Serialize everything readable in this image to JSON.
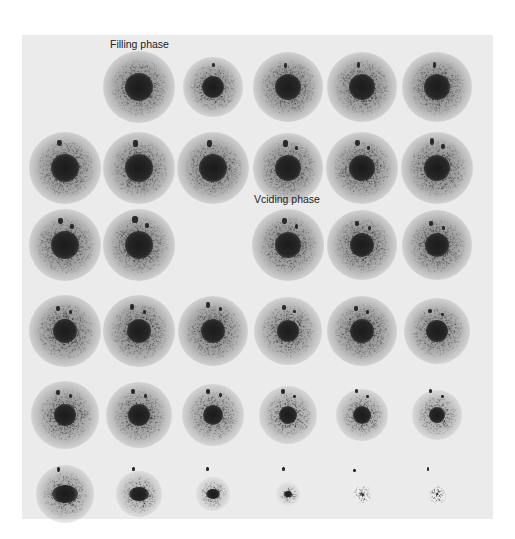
{
  "figure": {
    "labels": {
      "filling": "Filling phase",
      "voiding": "Vciding phase"
    },
    "colors": {
      "page_bg": "#ffffff",
      "panel_bg": "#ebebeb",
      "core": "#1b1b1b",
      "text": "#222222"
    },
    "grid": {
      "rows": 6,
      "cols": 6,
      "col_x": [
        65,
        139,
        213,
        288,
        362,
        437
      ],
      "row_y": [
        87,
        168,
        245,
        331,
        415,
        494
      ]
    },
    "frames": [
      {
        "row": 0,
        "col": 1,
        "r": 14,
        "halo": 28,
        "sats": []
      },
      {
        "row": 0,
        "col": 2,
        "r": 11,
        "halo": 23,
        "sats": [
          [
            0,
            -22,
            3,
            4
          ]
        ]
      },
      {
        "row": 0,
        "col": 3,
        "r": 13,
        "halo": 27,
        "sats": [
          [
            -3,
            -22,
            3,
            5
          ]
        ]
      },
      {
        "row": 0,
        "col": 4,
        "r": 13,
        "halo": 27,
        "sats": [
          [
            -4,
            -22,
            3,
            6
          ]
        ]
      },
      {
        "row": 0,
        "col": 5,
        "r": 13,
        "halo": 27,
        "sats": [
          [
            -3,
            -22,
            3,
            6
          ]
        ]
      },
      {
        "row": 1,
        "col": 0,
        "r": 14,
        "halo": 28,
        "sats": [
          [
            -6,
            -25,
            5,
            6
          ]
        ]
      },
      {
        "row": 1,
        "col": 1,
        "r": 14,
        "halo": 28,
        "sats": [
          [
            -4,
            -25,
            5,
            7
          ]
        ]
      },
      {
        "row": 1,
        "col": 2,
        "r": 14,
        "halo": 28,
        "sats": [
          [
            -4,
            -25,
            5,
            7
          ]
        ]
      },
      {
        "row": 1,
        "col": 3,
        "r": 13,
        "halo": 27,
        "sats": [
          [
            -3,
            -25,
            5,
            7
          ],
          [
            8,
            -20,
            3,
            4
          ]
        ]
      },
      {
        "row": 1,
        "col": 4,
        "r": 13,
        "halo": 28,
        "sats": [
          [
            -5,
            -25,
            5,
            6
          ],
          [
            6,
            -20,
            3,
            4
          ]
        ]
      },
      {
        "row": 1,
        "col": 5,
        "r": 13,
        "halo": 28,
        "sats": [
          [
            -5,
            -27,
            4,
            7
          ],
          [
            6,
            -22,
            4,
            5
          ]
        ]
      },
      {
        "row": 2,
        "col": 0,
        "r": 14,
        "halo": 28,
        "sats": [
          [
            -5,
            -24,
            5,
            6
          ],
          [
            7,
            -19,
            4,
            5
          ]
        ]
      },
      {
        "row": 2,
        "col": 1,
        "r": 14,
        "halo": 28,
        "sats": [
          [
            -4,
            -26,
            6,
            7
          ],
          [
            8,
            -20,
            4,
            5
          ]
        ]
      },
      {
        "row": 2,
        "col": 3,
        "r": 13,
        "halo": 28,
        "sats": [
          [
            -4,
            -24,
            5,
            6
          ],
          [
            8,
            -19,
            3,
            5
          ]
        ]
      },
      {
        "row": 2,
        "col": 4,
        "r": 12,
        "halo": 27,
        "sats": [
          [
            -5,
            -22,
            4,
            5
          ],
          [
            7,
            -17,
            3,
            4
          ]
        ]
      },
      {
        "row": 2,
        "col": 5,
        "r": 12,
        "halo": 27,
        "sats": [
          [
            -6,
            -22,
            4,
            5
          ],
          [
            6,
            -17,
            3,
            4
          ]
        ]
      },
      {
        "row": 3,
        "col": 0,
        "r": 12,
        "halo": 28,
        "sats": [
          [
            -7,
            -23,
            4,
            5
          ],
          [
            5,
            -19,
            3,
            4
          ]
        ]
      },
      {
        "row": 3,
        "col": 1,
        "r": 12,
        "halo": 28,
        "sats": [
          [
            -7,
            -24,
            4,
            6
          ],
          [
            5,
            -19,
            3,
            4
          ]
        ]
      },
      {
        "row": 3,
        "col": 2,
        "r": 12,
        "halo": 27,
        "sats": [
          [
            -5,
            -26,
            4,
            6
          ],
          [
            7,
            -22,
            3,
            4
          ]
        ]
      },
      {
        "row": 3,
        "col": 3,
        "r": 11,
        "halo": 26,
        "sats": [
          [
            -4,
            -24,
            4,
            5
          ],
          [
            6,
            -20,
            3,
            3
          ]
        ]
      },
      {
        "row": 3,
        "col": 4,
        "r": 12,
        "halo": 27,
        "sats": [
          [
            -6,
            -23,
            4,
            5
          ],
          [
            5,
            -19,
            3,
            4
          ]
        ]
      },
      {
        "row": 3,
        "col": 5,
        "r": 11,
        "halo": 25,
        "sats": [
          [
            -7,
            -20,
            4,
            4
          ],
          [
            5,
            -17,
            3,
            3
          ]
        ]
      },
      {
        "row": 4,
        "col": 0,
        "r": 11,
        "halo": 26,
        "sats": [
          [
            -7,
            -23,
            4,
            5
          ],
          [
            5,
            -19,
            3,
            4
          ]
        ]
      },
      {
        "row": 4,
        "col": 1,
        "r": 11,
        "halo": 25,
        "sats": [
          [
            -6,
            -24,
            4,
            5
          ],
          [
            6,
            -19,
            3,
            4
          ]
        ]
      },
      {
        "row": 4,
        "col": 2,
        "r": 10,
        "halo": 24,
        "sats": [
          [
            -5,
            -24,
            4,
            5
          ],
          [
            7,
            -20,
            3,
            4
          ]
        ]
      },
      {
        "row": 4,
        "col": 3,
        "r": 9,
        "halo": 22,
        "sats": [
          [
            -5,
            -24,
            4,
            5
          ],
          [
            6,
            -19,
            3,
            3
          ]
        ]
      },
      {
        "row": 4,
        "col": 4,
        "r": 9,
        "halo": 20,
        "sats": [
          [
            -6,
            -24,
            3,
            4
          ],
          [
            5,
            -19,
            3,
            3
          ]
        ]
      },
      {
        "row": 4,
        "col": 5,
        "r": 8,
        "halo": 19,
        "sats": [
          [
            -7,
            -24,
            3,
            4
          ],
          [
            5,
            -19,
            3,
            3
          ]
        ]
      },
      {
        "row": 5,
        "col": 0,
        "r": 9,
        "halo": 22,
        "sats": [
          [
            -7,
            -25,
            3,
            5
          ]
        ]
      },
      {
        "row": 5,
        "col": 1,
        "r": 7,
        "halo": 18,
        "sats": [
          [
            -6,
            -25,
            3,
            4
          ]
        ]
      },
      {
        "row": 5,
        "col": 2,
        "r": 5,
        "halo": 13,
        "sats": [
          [
            -6,
            -25,
            3,
            4
          ]
        ]
      },
      {
        "row": 5,
        "col": 3,
        "r": 3,
        "halo": 9,
        "sats": [
          [
            -5,
            -25,
            3,
            4
          ]
        ]
      },
      {
        "row": 5,
        "col": 4,
        "r": 0,
        "halo": 9,
        "sats": [
          [
            -8,
            -24,
            3,
            3
          ]
        ]
      },
      {
        "row": 5,
        "col": 5,
        "r": 0,
        "halo": 9,
        "sats": [
          [
            -9,
            -25,
            2,
            4
          ]
        ]
      }
    ]
  }
}
